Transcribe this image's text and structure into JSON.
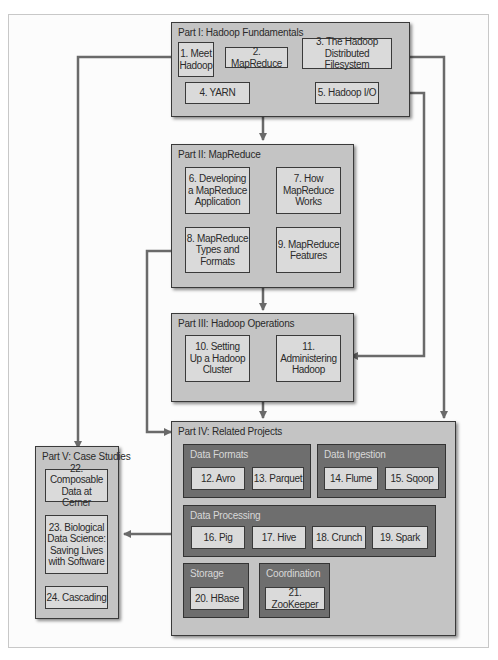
{
  "colors": {
    "part_fill": "#c4c4c4",
    "chapter_fill": "#dadada",
    "group_fill": "#6e6e6e",
    "border": "#3a3a3a",
    "arrow": "#6a6a6a"
  },
  "parts": {
    "p1": {
      "title": "Part I: Hadoop Fundamentals",
      "chapters": {
        "c1": "1. Meet\nHadoop",
        "c2": "2. MapReduce",
        "c3": "3. The Hadoop\nDistributed Filesystem",
        "c4": "4. YARN",
        "c5": "5. Hadoop I/O"
      }
    },
    "p2": {
      "title": "Part II: MapReduce",
      "chapters": {
        "c6": "6. Developing\na MapReduce\nApplication",
        "c7": "7. How\nMapReduce\nWorks",
        "c8": "8. MapReduce\nTypes and\nFormats",
        "c9": "9. MapReduce\nFeatures"
      }
    },
    "p3": {
      "title": "Part III: Hadoop Operations",
      "chapters": {
        "c10": "10. Setting\nUp a Hadoop\nCluster",
        "c11": "11.\nAdministering\nHadoop"
      }
    },
    "p4": {
      "title": "Part IV: Related Projects",
      "groups": {
        "formats": {
          "title": "Data Formats",
          "c12": "12. Avro",
          "c13": "13. Parquet"
        },
        "ingestion": {
          "title": "Data Ingestion",
          "c14": "14. Flume",
          "c15": "15. Sqoop"
        },
        "processing": {
          "title": "Data Processing",
          "c16": "16. Pig",
          "c17": "17. Hive",
          "c18": "18. Crunch",
          "c19": "19. Spark"
        },
        "storage": {
          "title": "Storage",
          "c20": "20. HBase"
        },
        "coordination": {
          "title": "Coordination",
          "c21": "21. ZooKeeper"
        }
      }
    },
    "p5": {
      "title": "Part V: Case Studies",
      "chapters": {
        "c22": "22. Composable\nData at Cerner",
        "c23": "23. Biological\nData Science:\nSaving Lives\nwith Software",
        "c24": "24. Cascading"
      }
    }
  }
}
